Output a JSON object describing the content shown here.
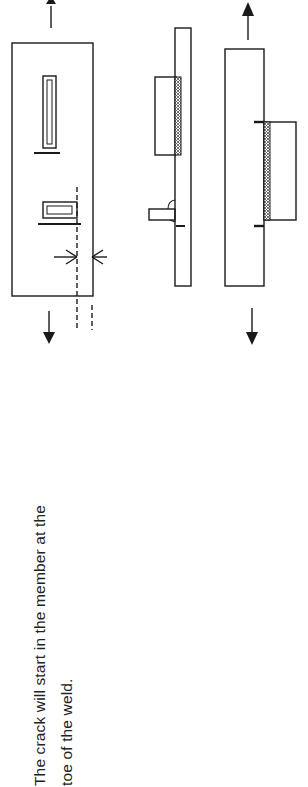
{
  "figure": {
    "caption_lines": [
      "The crack will start in the member at the",
      "toe of the weld."
    ],
    "panels": [
      {
        "id": "plan-view",
        "description": "Plate under tension with two welded attachments (longitudinal and transverse), crack location marked by dashed section line and converging arrows"
      },
      {
        "id": "side-view-attachments",
        "description": "Side elevation of plate with fillet-welded cover attachment and stub"
      },
      {
        "id": "side-view-lap",
        "description": "Side elevation of plate with welded lap plate under tension"
      }
    ],
    "colors": {
      "ink": "#1a1a1a",
      "weld_hatch": "#555555",
      "background": "#ffffff"
    }
  }
}
